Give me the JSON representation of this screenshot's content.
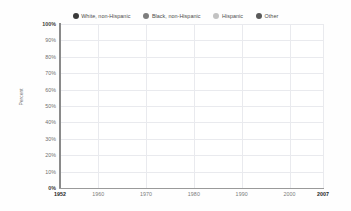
{
  "chart_data": {
    "type": "line",
    "title": "",
    "xlabel": "",
    "ylabel": "Percent",
    "x": [
      1952,
      1960,
      1970,
      1980,
      1990,
      2000,
      2007
    ],
    "xlim": [
      1952,
      2007
    ],
    "ylim": [
      0,
      100
    ],
    "grid": true,
    "legend_position": "top-center",
    "x_tick_labels": [
      "1952",
      "1960",
      "1970",
      "1980",
      "1990",
      "2000",
      "2007"
    ],
    "y_tick_labels": [
      "0%",
      "10%",
      "20%",
      "30%",
      "40%",
      "50%",
      "60%",
      "70%",
      "80%",
      "90%",
      "100%"
    ],
    "y_tick_values": [
      0,
      10,
      20,
      30,
      40,
      50,
      60,
      70,
      80,
      90,
      100
    ],
    "series": [
      {
        "name": "White, non-Hispanic",
        "color": "#6e6e6e",
        "x": [
          1952,
          1956,
          1960,
          1964,
          1968,
          1972,
          1976,
          1980,
          1984,
          1988,
          1992,
          1996,
          2000,
          2004,
          2007
        ],
        "values": [
          22,
          23,
          24,
          24,
          26,
          33,
          38,
          44,
          52,
          57,
          60,
          60,
          62,
          65,
          71
        ]
      },
      {
        "name": "Black, non-Hispanic",
        "color": "#8a8a8a",
        "x": [
          1952,
          1956,
          1960,
          1964,
          1968,
          1972,
          1976,
          1980,
          1984,
          1988,
          1992,
          1996,
          1998,
          2002,
          2007
        ],
        "values": [
          14,
          13,
          13,
          12,
          13,
          15,
          16,
          17,
          21,
          22,
          23,
          26,
          33,
          27,
          34
        ]
      },
      {
        "name": "Hispanic",
        "color": "#b4b4b4",
        "x": [
          1952,
          1956,
          1960,
          1964,
          1968,
          1972,
          1976,
          1980,
          1984,
          1988,
          1992,
          1996,
          2000,
          2004,
          2007
        ],
        "values": [
          12,
          14,
          14,
          13,
          14,
          16,
          17,
          18,
          24,
          25,
          26,
          28,
          33,
          38,
          61
        ]
      },
      {
        "name": "Other",
        "color": "#707070",
        "x": [
          1952,
          1956,
          1960,
          1964,
          1968,
          1972,
          1976,
          1980,
          1984,
          1988,
          1992,
          1996,
          2000,
          2004,
          2007
        ],
        "values": [
          6,
          6,
          7,
          7,
          8,
          9,
          10,
          11,
          13,
          15,
          17,
          19,
          23,
          27,
          33
        ]
      }
    ]
  },
  "legend": {
    "items": [
      {
        "label": "White, non-Hispanic",
        "color": "#3a3a3a"
      },
      {
        "label": "Black, non-Hispanic",
        "color": "#7d7d7d"
      },
      {
        "label": "Hispanic",
        "color": "#c2c2c2"
      },
      {
        "label": "Other",
        "color": "#5a5a5a"
      }
    ]
  }
}
